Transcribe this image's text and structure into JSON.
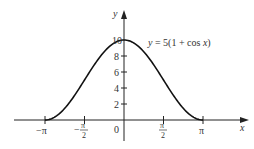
{
  "chart_data": {
    "type": "line",
    "title": "",
    "equation_label": "y = 5(1 + cos x)",
    "xlabel": "x",
    "ylabel": "y",
    "xlim": [
      -3.14159,
      3.14159
    ],
    "ylim": [
      0,
      10
    ],
    "x_ticks": [
      "−π",
      "−π/2",
      "0",
      "π/2",
      "π"
    ],
    "x_tick_values": [
      -3.14159,
      -1.5708,
      0,
      1.5708,
      3.14159
    ],
    "y_ticks": [
      "2",
      "4",
      "6",
      "8",
      "10"
    ],
    "y_tick_values": [
      2,
      4,
      6,
      8,
      10
    ],
    "series": [
      {
        "name": "y = 5(1 + cos x)",
        "x": [
          -3.14159,
          -2.356,
          -1.5708,
          -0.7854,
          0,
          0.7854,
          1.5708,
          2.356,
          3.14159
        ],
        "values": [
          0,
          1.46,
          5,
          8.54,
          10,
          8.54,
          5,
          1.46,
          0
        ]
      }
    ],
    "grid": false,
    "legend": "none"
  },
  "labels": {
    "y_axis": "y",
    "x_axis": "x",
    "equation_lhs": "y",
    "equation_rhs": " = 5(1 + cos ",
    "equation_var": "x",
    "equation_close": ")",
    "zero": "0",
    "neg_pi": "−π",
    "pi": "π",
    "pi_num": "π",
    "two": "2",
    "minus": "−",
    "y10": "10",
    "y8": "8",
    "y6": "6",
    "y4": "4",
    "y2": "2"
  }
}
